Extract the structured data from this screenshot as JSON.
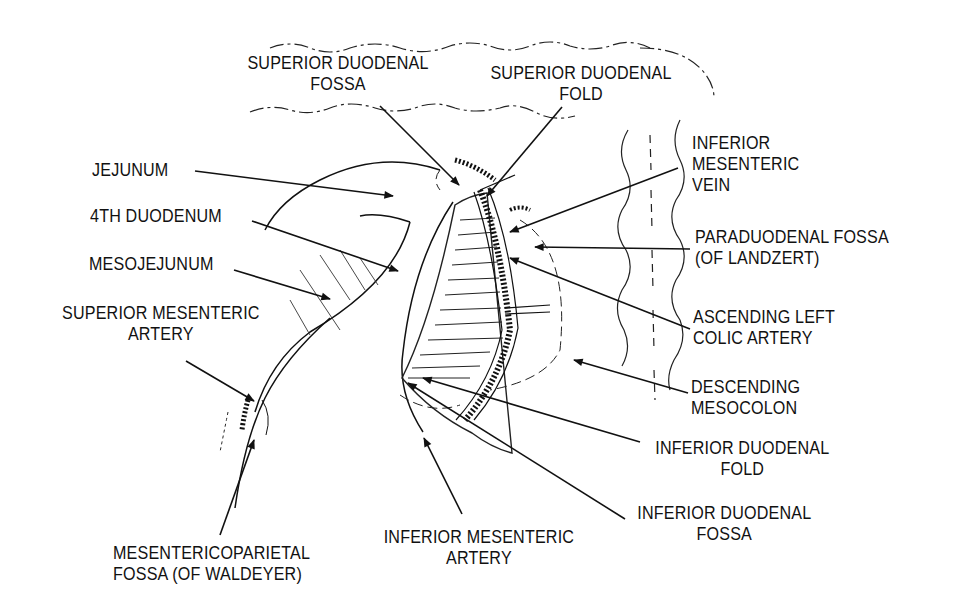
{
  "figure": {
    "type": "anatomical line drawing",
    "ink_color": "#111111",
    "background": "#ffffff"
  },
  "labels": {
    "superior_duodenal_fossa": {
      "line1": "SUPERIOR DUODENAL",
      "line2": "FOSSA"
    },
    "superior_duodenal_fold": {
      "line1": "SUPERIOR DUODENAL",
      "line2": "FOLD"
    },
    "inferior_mesenteric_vein": {
      "line1": "INFERIOR",
      "line2": "MESENTERIC",
      "line3": "VEIN"
    },
    "paraduodenal_fossa": {
      "line1": "PARADUODENAL FOSSA",
      "line2": "(OF LANDZERT)"
    },
    "ascending_left_colic_artery": {
      "line1": "ASCENDING LEFT",
      "line2": "COLIC ARTERY"
    },
    "descending_mesocolon": {
      "line1": "DESCENDING",
      "line2": "MESOCOLON"
    },
    "inferior_duodenal_fold": {
      "line1": "INFERIOR DUODENAL",
      "line2": "FOLD"
    },
    "inferior_duodenal_fossa": {
      "line1": "INFERIOR DUODENAL",
      "line2": "FOSSA"
    },
    "inferior_mesenteric_artery": {
      "line1": "INFERIOR MESENTERIC",
      "line2": "ARTERY"
    },
    "mesentericoparietal_fossa": {
      "line1": "MESENTERICOPARIETAL",
      "line2": "FOSSA (OF WALDEYER)"
    },
    "jejunum": {
      "line1": "JEJUNUM"
    },
    "fourth_duodenum": {
      "line1": "4TH DUODENUM"
    },
    "mesojejunum": {
      "line1": "MESOJEJUNUM"
    },
    "superior_mesenteric_artery": {
      "line1": "SUPERIOR MESENTERIC",
      "line2": "ARTERY"
    }
  }
}
